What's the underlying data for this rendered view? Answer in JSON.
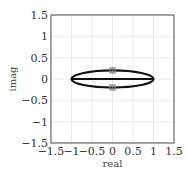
{
  "chart_data": {
    "type": "line",
    "title": "",
    "xlabel": "real",
    "ylabel": "imag",
    "xlim": [
      -1.5,
      1.5
    ],
    "ylim": [
      -1.5,
      1.5
    ],
    "grid": true,
    "xticks": [
      -1.5,
      -1,
      -0.5,
      0,
      0.5,
      1,
      1.5
    ],
    "yticks": [
      -1.5,
      -1,
      -0.5,
      0,
      0.5,
      1,
      1.5
    ],
    "xtick_labels": [
      "−1.5",
      "−1",
      "−0.5",
      "0",
      "0.5",
      "1",
      "1.5"
    ],
    "ytick_labels": [
      "−1.5",
      "−1",
      "−0.5",
      "0",
      "0.5",
      "1",
      "1.5"
    ],
    "series": [
      {
        "name": "ellipse",
        "kind": "ellipse",
        "center": [
          0,
          0
        ],
        "rx": 1.0,
        "ry": 0.2,
        "color": "#111111"
      },
      {
        "name": "real-axis-segment",
        "kind": "line",
        "x": [
          -1,
          1
        ],
        "y": [
          0,
          0
        ],
        "color": "#111111"
      },
      {
        "name": "markers",
        "kind": "scatter",
        "x": [
          0,
          0
        ],
        "y": [
          0.2,
          -0.2
        ],
        "color": "#888888",
        "marker": "square"
      }
    ],
    "legend": null
  },
  "colors": {
    "frame": "#555555",
    "grid": "#e3e3e3",
    "curve": "#111111",
    "marker": "#888888"
  }
}
